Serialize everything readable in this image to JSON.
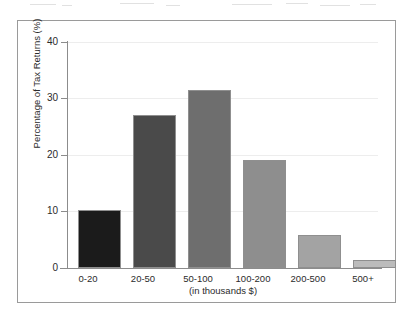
{
  "chart_data": {
    "type": "bar",
    "title": "",
    "subtitle": "",
    "xlabel": "(in thousands $)",
    "ylabel": "Percentage of Tax Returns (%)",
    "categories": [
      "0-20",
      "20-50",
      "50-100",
      "100-200",
      "200-500",
      "500+"
    ],
    "values": [
      10.8,
      28.5,
      33.0,
      20.0,
      6.2,
      1.4
    ],
    "series": [
      {
        "name": "Percentage of Tax Returns",
        "values": [
          10.8,
          28.5,
          33.0,
          20.0,
          6.2,
          1.4
        ]
      }
    ],
    "bar_colors": [
      "#1b1b1b",
      "#4a4a4a",
      "#6e6e6e",
      "#8e8e8e",
      "#a3a3a3",
      "#bcbcbc"
    ],
    "ylim": [
      0,
      42
    ],
    "yticks": [
      0,
      10,
      20,
      30,
      40
    ],
    "ytick_labels": [
      "0",
      "10",
      "20",
      "30",
      "40"
    ],
    "grid": true,
    "legend": "none",
    "legend_position": "none"
  },
  "axes": {
    "y_title": "Percentage of Tax Returns (%)",
    "x_title": "(in thousands $)",
    "y_ticks": [
      {
        "label": "40",
        "value": 40
      },
      {
        "label": "30",
        "value": 30
      },
      {
        "label": "20",
        "value": 20
      },
      {
        "label": "10",
        "value": 10
      },
      {
        "label": "0",
        "value": 0
      }
    ],
    "x_ticks": [
      {
        "label": "0-20"
      },
      {
        "label": "20-50"
      },
      {
        "label": "50-100"
      },
      {
        "label": "100-200"
      },
      {
        "label": "200-500"
      },
      {
        "label": "500+"
      }
    ]
  },
  "style": {
    "frame_color": "#9a9a9a",
    "axis_color": "#8c8c8c",
    "grid_color": "#ededed",
    "background": "#ffffff",
    "text_color": "#2b2b2b"
  }
}
